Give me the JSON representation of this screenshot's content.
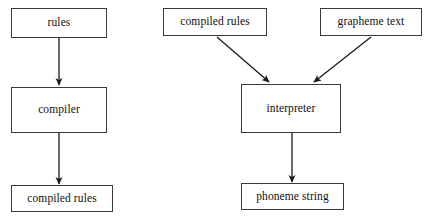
{
  "diagram": {
    "background_color": "#ffffff",
    "border_color": "#3a3a3a",
    "arrow_color": "#1a1a1a",
    "nodes": [
      {
        "id": "rules",
        "label": "rules"
      },
      {
        "id": "compiler",
        "label": "compiler"
      },
      {
        "id": "compiled_rules_out",
        "label": "compiled rules"
      },
      {
        "id": "compiled_rules_in",
        "label": "compiled rules"
      },
      {
        "id": "grapheme_text",
        "label": "grapheme text"
      },
      {
        "id": "interpreter",
        "label": "interpreter"
      },
      {
        "id": "phoneme_string",
        "label": "phoneme string"
      }
    ],
    "edges": [
      {
        "id": "e1",
        "from": "rules",
        "to": "compiler",
        "style": "vertical-down"
      },
      {
        "id": "e2",
        "from": "compiler",
        "to": "compiled_rules_out",
        "style": "vertical-down"
      },
      {
        "id": "e3",
        "from": "compiled_rules_in",
        "to": "interpreter",
        "style": "diagonal-down-right"
      },
      {
        "id": "e4",
        "from": "grapheme_text",
        "to": "interpreter",
        "style": "diagonal-down-left"
      },
      {
        "id": "e5",
        "from": "interpreter",
        "to": "phoneme_string",
        "style": "vertical-down"
      }
    ]
  }
}
